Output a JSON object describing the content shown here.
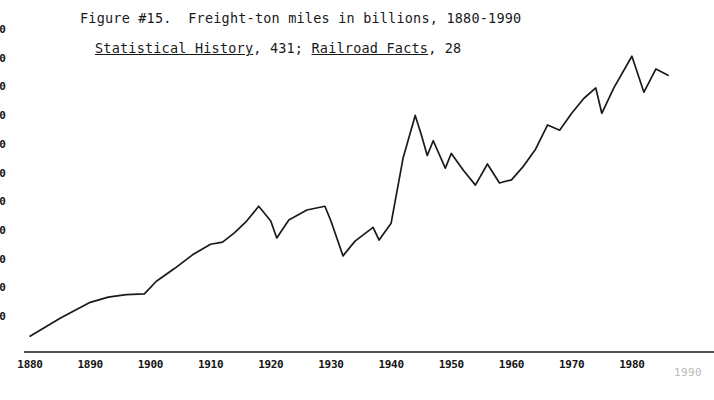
{
  "caption": {
    "line1": "Figure #15.  Freight-ton miles in billions, 1880-1990",
    "line2_source1": "Statistical History",
    "line2_page1": ", 431; ",
    "line2_source2": "Railroad Facts",
    "line2_page2": ", 28"
  },
  "chart_data": {
    "type": "line",
    "title": "Figure #15.  Freight-ton miles in billions, 1880-1990",
    "subtitle": "Statistical History, 431; Railroad Facts, 28",
    "xlabel": "",
    "ylabel": "",
    "grid": false,
    "legend": null,
    "xlim": [
      1880,
      1990
    ],
    "ylim": [
      0,
      1600
    ],
    "xticks": [
      1880,
      1890,
      1900,
      1910,
      1920,
      1930,
      1940,
      1950,
      1960,
      1970,
      1980,
      1990
    ],
    "xticklabels": [
      "1880",
      "1890",
      "1900",
      "1910",
      "1920",
      "1930",
      "1940",
      "1950",
      "1960",
      "1970",
      "1980",
      "1990"
    ],
    "yticks": [
      1500,
      1400,
      1300,
      1200,
      1100,
      1000,
      900,
      800,
      700,
      600,
      500
    ],
    "yticklabels": [
      "00",
      "00",
      "00",
      "00",
      "00",
      "00",
      "00",
      "00",
      "00",
      "00",
      "00"
    ],
    "ytick_note": "y-axis numerals are clipped by the left page margin; only the trailing '00' of each label is visible",
    "x": [
      1880,
      1885,
      1890,
      1893,
      1896,
      1899,
      1901,
      1904,
      1907,
      1910,
      1912,
      1914,
      1916,
      1918,
      1920,
      1921,
      1923,
      1926,
      1929,
      1930,
      1932,
      1934,
      1937,
      1938,
      1940,
      1942,
      1944,
      1945,
      1946,
      1947,
      1949,
      1950,
      1952,
      1954,
      1956,
      1958,
      1960,
      1962,
      1964,
      1966,
      1968,
      1970,
      1972,
      1974,
      1975,
      1977,
      1980,
      1982,
      1984,
      1986
    ],
    "y": [
      75,
      160,
      235,
      260,
      272,
      275,
      335,
      395,
      460,
      510,
      520,
      565,
      620,
      690,
      620,
      540,
      625,
      672,
      690,
      620,
      455,
      525,
      590,
      530,
      610,
      920,
      1120,
      1030,
      930,
      1000,
      870,
      940,
      860,
      790,
      890,
      800,
      815,
      880,
      960,
      1075,
      1050,
      1130,
      1200,
      1250,
      1130,
      1250,
      1400,
      1230,
      1340,
      1310
    ],
    "series_name": "Freight-ton miles (billions)",
    "annotations": [
      {
        "label": "WWI peak",
        "x": 1918
      },
      {
        "label": "late-1920s peak",
        "x": 1929
      },
      {
        "label": "Depression trough",
        "x": 1932
      },
      {
        "label": "WWII maximum",
        "x": 1944
      },
      {
        "label": "1960 trough",
        "x": 1960
      },
      {
        "label": "all-time peak",
        "x": 1980
      }
    ]
  },
  "axes": {
    "y_tick_labels": [
      "00",
      "00",
      "00",
      "00",
      "00",
      "00",
      "00",
      "00",
      "00",
      "00",
      "00"
    ],
    "x_tick_labels": [
      "1880",
      "1890",
      "1900",
      "1910",
      "1920",
      "1930",
      "1940",
      "1950",
      "1960",
      "1970",
      "1980"
    ],
    "x_tick_label_faded": "1990"
  },
  "style": {
    "ink": "#1a1a1a",
    "paper": "#ffffff",
    "faded_ink": "#b9b9b9"
  }
}
